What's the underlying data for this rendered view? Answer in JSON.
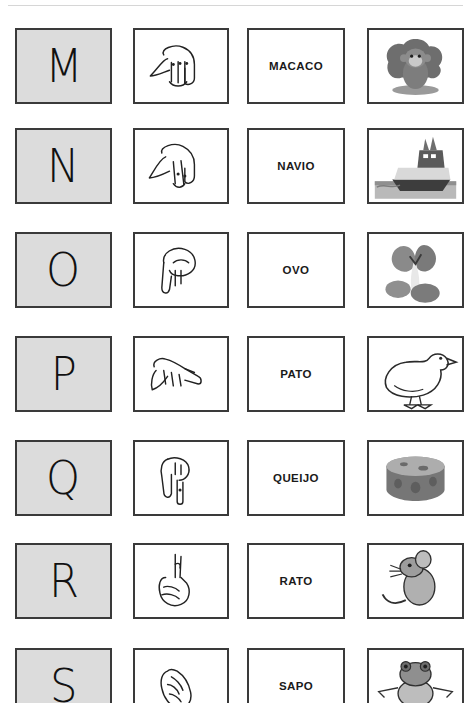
{
  "page": {
    "background_color": "#ffffff",
    "letter_cell_fill": "#dcdcdc",
    "border_color": "#3a3a3a",
    "rule_color": "#d6d6d6",
    "columns": [
      {
        "key": "letter",
        "name": "letter-cell"
      },
      {
        "key": "sign",
        "name": "sign-cell"
      },
      {
        "key": "word",
        "name": "word-cell"
      },
      {
        "key": "picture",
        "name": "picture-cell"
      }
    ]
  },
  "rows": [
    {
      "letter": "M",
      "word": "MACACO",
      "sign_name": "libras-hand-m-icon",
      "picture_name": "monkey-illustration",
      "top": 28
    },
    {
      "letter": "N",
      "word": "NAVIO",
      "sign_name": "libras-hand-n-icon",
      "picture_name": "ship-illustration",
      "top": 128
    },
    {
      "letter": "O",
      "word": "OVO",
      "sign_name": "libras-hand-o-icon",
      "picture_name": "eggs-illustration",
      "top": 232
    },
    {
      "letter": "P",
      "word": "PATO",
      "sign_name": "libras-hand-p-icon",
      "picture_name": "duck-illustration",
      "top": 336
    },
    {
      "letter": "Q",
      "word": "QUEIJO",
      "sign_name": "libras-hand-q-icon",
      "picture_name": "cheese-illustration",
      "top": 440
    },
    {
      "letter": "R",
      "word": "RATO",
      "sign_name": "libras-hand-r-icon",
      "picture_name": "mouse-illustration",
      "top": 543
    },
    {
      "letter": "S",
      "word": "SAPO",
      "sign_name": "libras-hand-s-icon",
      "picture_name": "frog-illustration",
      "top": 648
    }
  ]
}
